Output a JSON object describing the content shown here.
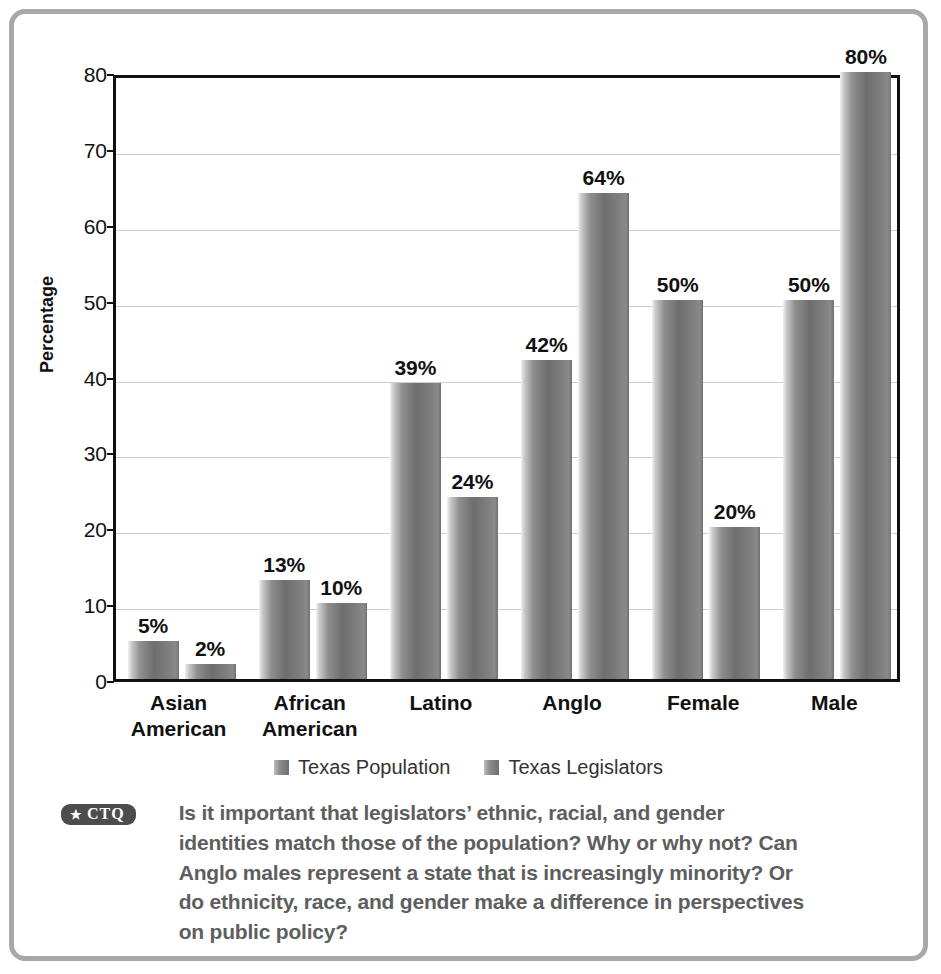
{
  "chart_data": {
    "type": "bar",
    "title": "",
    "xlabel": "",
    "ylabel": "Percentage",
    "ylim": [
      0,
      80
    ],
    "yticks": [
      0,
      10,
      20,
      30,
      40,
      50,
      60,
      70,
      80
    ],
    "ytick_labels": [
      "0",
      "10",
      "20",
      "30",
      "40",
      "50",
      "60",
      "70",
      "80"
    ],
    "grid": true,
    "legend_position": "bottom",
    "categories": [
      "Asian American",
      "African American",
      "Latino",
      "Anglo",
      "Female",
      "Male"
    ],
    "category_lines": [
      [
        "Asian",
        "American"
      ],
      [
        "African",
        "American"
      ],
      [
        "Latino"
      ],
      [
        "Anglo"
      ],
      [
        "Female"
      ],
      [
        "Male"
      ]
    ],
    "series": [
      {
        "name": "Texas Population",
        "values": [
          5,
          13,
          39,
          42,
          50,
          50
        ],
        "labels": [
          "5%",
          "13%",
          "39%",
          "42%",
          "50%",
          "50%"
        ],
        "color": "#7a7a7a"
      },
      {
        "name": "Texas Legislators",
        "values": [
          2,
          10,
          24,
          64,
          20,
          80
        ],
        "labels": [
          "2%",
          "10%",
          "24%",
          "64%",
          "20%",
          "80%"
        ],
        "color": "#7a7a7a"
      }
    ]
  },
  "legend": {
    "items": [
      {
        "label": "Texas Population"
      },
      {
        "label": "Texas Legislators"
      }
    ]
  },
  "caption": {
    "badge_star": "★",
    "badge_text": "CTQ",
    "text": "Is it important that legislators’ ethnic, racial, and gender identities match those of the population? Why or why not? Can Anglo males represent a state that is increasingly minority? Or do ethnicity, race, and gender make a difference in perspectives on public policy?"
  },
  "colors": {
    "frame_border": "#a8a8a8",
    "axis": "#111111",
    "gridline": "#cfcfcf",
    "bar_dark": "#6e6e6e",
    "bar_light": "#f2f2f2",
    "caption_text": "#5e5e5e",
    "badge_bg": "#4c4c4c",
    "background": "#ffffff"
  }
}
